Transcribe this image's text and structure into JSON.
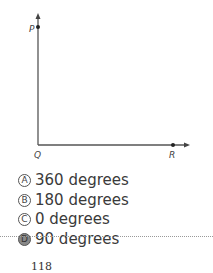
{
  "diagram": {
    "labels": {
      "p": "P",
      "q": "Q",
      "r": "R"
    }
  },
  "choices": [
    {
      "letter": "A",
      "text": "360 degrees"
    },
    {
      "letter": "B",
      "text": "180 degrees"
    },
    {
      "letter": "C",
      "text": "0 degrees"
    },
    {
      "letter": "D",
      "text": "90 degrees",
      "selected": true
    }
  ],
  "page_number": "118"
}
